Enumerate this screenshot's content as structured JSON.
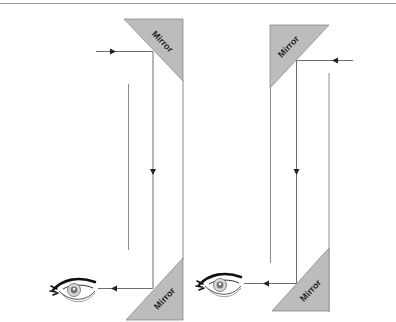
{
  "diagram": {
    "colors": {
      "mirror_fill": "#bcbcbc",
      "mirror_stroke": "#8a8a8a",
      "line": "#8c8c8c",
      "ray": "#6e6e6e",
      "arrowhead": "#222222",
      "label": "#1e1e1e",
      "top_rule": "#9a9a9a"
    },
    "left_periscope": {
      "top_mirror": {
        "label": "Mirror"
      },
      "bottom_mirror": {
        "label": "Mirror"
      },
      "input_ray_direction": "left-to-right",
      "output_ray_direction": "right-to-left",
      "viewer": "eye-icon"
    },
    "right_periscope": {
      "top_mirror": {
        "label": "Mirror"
      },
      "bottom_mirror": {
        "label": "Mirror"
      },
      "input_ray_direction": "right-to-left",
      "output_ray_direction": "right-to-left",
      "viewer": "eye-icon"
    }
  }
}
